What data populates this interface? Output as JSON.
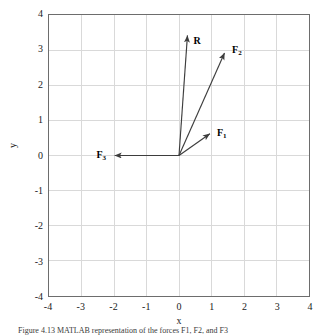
{
  "figure": {
    "caption": "Figure  4.13  MATLAB representation of the forces F1, F2, and F3"
  },
  "axes": {
    "xlabel": "x",
    "ylabel": "y",
    "xticks": [
      "-4",
      "-3",
      "-2",
      "-1",
      "0",
      "1",
      "2",
      "3",
      "4"
    ],
    "yticks": [
      "4",
      "3",
      "2",
      "1",
      "0",
      "-1",
      "-2",
      "-3",
      "-4"
    ],
    "grid_color": "#d9d9d9",
    "frame_color": "#6d6d6d",
    "vector_color": "#3d3d3d"
  },
  "chart_data": {
    "type": "line",
    "title": "",
    "xlabel": "x",
    "ylabel": "y",
    "xlim": [
      -4,
      4
    ],
    "ylim": [
      -4,
      4
    ],
    "xticks": [
      -4,
      -3,
      -2,
      -1,
      0,
      1,
      2,
      3,
      4
    ],
    "yticks": [
      -4,
      -3,
      -2,
      -1,
      0,
      1,
      2,
      3,
      4
    ],
    "grid": true,
    "legend": "none",
    "origin": [
      0,
      0
    ],
    "series": [
      {
        "name": "F1",
        "label": "F₁",
        "type": "vector",
        "start": [
          0,
          0
        ],
        "end": [
          0.95,
          0.62
        ],
        "label_position": [
          1.16,
          0.78
        ],
        "color": "#3d3d3d"
      },
      {
        "name": "F2",
        "label": "F₂",
        "type": "vector",
        "start": [
          0,
          0
        ],
        "end": [
          1.4,
          2.92
        ],
        "label_position": [
          1.62,
          3.12
        ],
        "color": "#3d3d3d"
      },
      {
        "name": "R",
        "label": "R",
        "type": "vector",
        "start": [
          0,
          0
        ],
        "end": [
          0.26,
          3.42
        ],
        "label_position": [
          0.44,
          3.38
        ],
        "color": "#3d3d3d"
      },
      {
        "name": "F3",
        "label": "F₃",
        "type": "vector",
        "start": [
          0,
          0
        ],
        "end": [
          -1.98,
          0
        ],
        "label_position": [
          -2.52,
          0.16
        ],
        "color": "#3d3d3d"
      }
    ]
  }
}
